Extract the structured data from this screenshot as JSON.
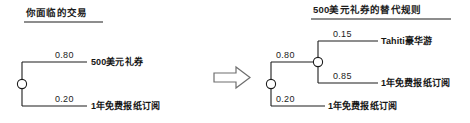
{
  "diagram": {
    "type": "probability-tree-pair",
    "background_color": "#ffffff",
    "line_color": "#1c1c1c",
    "node_fill": "#ffffff",
    "transition_icon": "right-arrow-icon"
  },
  "left_panel": {
    "title": "你面临的交易",
    "root_node_label": "chance-node",
    "branches": [
      {
        "probability": "0.80",
        "outcome": "500美元礼券"
      },
      {
        "probability": "0.20",
        "outcome": "1年免费报纸订阅"
      }
    ]
  },
  "right_panel": {
    "title": "500美元礼券的替代规则",
    "root_node_label": "chance-node",
    "branches": [
      {
        "probability": "0.80",
        "outcome": "",
        "sub_node_label": "chance-node",
        "sub_branches": [
          {
            "probability": "0.15",
            "outcome": "Tahiti豪华游"
          },
          {
            "probability": "0.85",
            "outcome": "1年免费报纸订阅"
          }
        ]
      },
      {
        "probability": "0.20",
        "outcome": "1年免费报纸订阅"
      }
    ]
  }
}
